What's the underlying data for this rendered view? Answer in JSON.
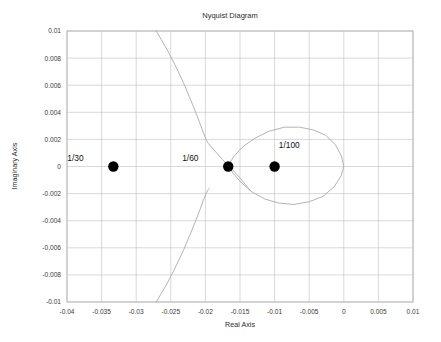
{
  "figure": {
    "title": "Nyquist Diagram",
    "background_color": "#ffffff",
    "grid_color": "#c8c8c8",
    "frame_color": "#b4b4b4",
    "curve_color": "#a7a7a7",
    "marker_color": "#000000"
  },
  "axes": {
    "xlabel": "Real Axis",
    "ylabel": "Imaginary Axis",
    "x_ticks": [
      "-0.04",
      "-0.035",
      "-0.03",
      "-0.025",
      "-0.02",
      "-0.015",
      "-0.01",
      "-0.005",
      "0",
      "0.005",
      "0.01"
    ],
    "y_ticks": [
      "0.01",
      "0.008",
      "0.006",
      "0.004",
      "0.002",
      "0",
      "-0.002",
      "-0.004",
      "-0.006",
      "-0.008",
      "-0.01"
    ]
  },
  "chart_data": {
    "type": "line",
    "title": "Nyquist Diagram",
    "xlabel": "Real Axis",
    "ylabel": "Imaginary Axis",
    "xlim": [
      -0.04,
      0.01
    ],
    "ylim": [
      -0.01,
      0.01
    ],
    "x_tick_values": [
      -0.04,
      -0.035,
      -0.03,
      -0.025,
      -0.02,
      -0.015,
      -0.01,
      -0.005,
      0,
      0.005,
      0.01
    ],
    "y_tick_values": [
      0.01,
      0.008,
      0.006,
      0.004,
      0.002,
      0,
      -0.002,
      -0.004,
      -0.006,
      -0.008,
      -0.01
    ],
    "grid": true,
    "legend": "none",
    "series": [
      {
        "name": "nyquist-branch-upper-left",
        "comment": "descending branch entering from top of frame",
        "x": [
          -0.0271,
          -0.0255,
          -0.0242,
          -0.0231,
          -0.0222,
          -0.0214,
          -0.0208,
          -0.0203,
          -0.0199,
          -0.0196,
          -0.0194
        ],
        "y": [
          0.01,
          0.0086,
          0.0073,
          0.0061,
          0.005,
          0.004,
          0.0032,
          0.0025,
          0.002,
          0.0017,
          0.0016
        ]
      },
      {
        "name": "nyquist-branch-upper-right",
        "comment": "from knee down through the 1/60 crossing and continuing lower-right",
        "x": [
          -0.0194,
          -0.0189,
          -0.0182,
          -0.0175,
          -0.0167,
          -0.0158,
          -0.0149,
          -0.0141,
          -0.0135
        ],
        "y": [
          0.0016,
          0.0013,
          0.0009,
          0.0005,
          0.0001,
          -0.0004,
          -0.0009,
          -0.0014,
          -0.0018
        ]
      },
      {
        "name": "nyquist-branch-lower",
        "comment": "ascending branch exiting the bottom of frame, mirror of upper",
        "x": [
          -0.0271,
          -0.0255,
          -0.0242,
          -0.0231,
          -0.0222,
          -0.0214,
          -0.0208,
          -0.0203,
          -0.0199,
          -0.0196,
          -0.0194
        ],
        "y": [
          -0.01,
          -0.0086,
          -0.0073,
          -0.0061,
          -0.005,
          -0.004,
          -0.0032,
          -0.0025,
          -0.002,
          -0.0017,
          -0.0016
        ]
      },
      {
        "name": "nyquist-lobe",
        "comment": "closed teardrop loop on the right, from the 1/60 crossing out to the origin",
        "x": [
          -0.0167,
          -0.0158,
          -0.0145,
          -0.0128,
          -0.0108,
          -0.0086,
          -0.0064,
          -0.0044,
          -0.0026,
          -0.0012,
          -0.0003,
          0.0,
          -0.0004,
          -0.0014,
          -0.003,
          -0.005,
          -0.0072,
          -0.0094,
          -0.0114,
          -0.0132,
          -0.0148,
          -0.016,
          -0.0167
        ],
        "y": [
          0.0001,
          0.0008,
          0.0015,
          0.0021,
          0.0026,
          0.0029,
          0.0029,
          0.0027,
          0.0023,
          0.0016,
          0.0007,
          0.0,
          -0.0007,
          -0.0015,
          -0.0022,
          -0.0026,
          -0.0028,
          -0.0027,
          -0.0024,
          -0.0019,
          -0.0012,
          -0.0005,
          0.0001
        ]
      }
    ],
    "markers": [
      {
        "label": "1/30",
        "x": -0.0333,
        "y": 0.0,
        "label_dx": -0.0043,
        "label_dy": 0.0004
      },
      {
        "label": "1/60",
        "x": -0.0167,
        "y": 0.0,
        "label_dx": -0.0043,
        "label_dy": 0.0004
      },
      {
        "label": "1/100",
        "x": -0.01,
        "y": 0.0,
        "label_dx": 0.0006,
        "label_dy": 0.0014
      }
    ]
  }
}
